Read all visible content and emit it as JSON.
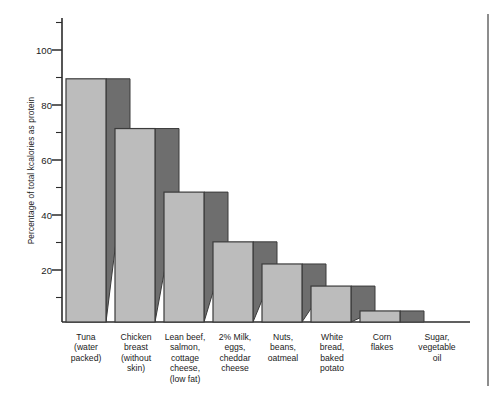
{
  "chart_data": {
    "type": "bar",
    "title": "",
    "xlabel": "",
    "ylabel": "Percentage of total kcalories as protein",
    "ylim": [
      0,
      110
    ],
    "ytick_labels": [
      "20",
      "40",
      "60",
      "80",
      "100"
    ],
    "ytick_values": [
      20,
      40,
      60,
      80,
      100
    ],
    "minor_tick_interval": 10,
    "grid": false,
    "legend": "none",
    "categories": [
      "Tuna (water packed)",
      "Chicken breast (without skin)",
      "Lean beef, salmon, cottage cheese, (low fat)",
      "2% Milk, eggs, cheddar cheese",
      "Nuts, beans, oatmeal",
      "White bread, baked potato",
      "Corn flakes",
      "Sugar, vegetable oil"
    ],
    "category_lines": [
      [
        "Tuna",
        "(water",
        "packed)"
      ],
      [
        "Chicken",
        "breast",
        "(without",
        "skin)"
      ],
      [
        "Lean beef,",
        "salmon,",
        "cottage",
        "cheese,",
        "(low fat)"
      ],
      [
        "2% Milk,",
        "eggs,",
        "cheddar",
        "cheese"
      ],
      [
        "Nuts,",
        "beans,",
        "oatmeal"
      ],
      [
        "White",
        "bread,",
        "baked",
        "potato"
      ],
      [
        "Corn",
        "flakes"
      ],
      [
        "Sugar,",
        "vegetable",
        "oil"
      ]
    ],
    "values": [
      88,
      70,
      47,
      29,
      21,
      13,
      4,
      0
    ],
    "colors": {
      "bar_face": "#bcbcbc",
      "bar_side": "#6e6e6e",
      "bar_outline": "#3b3b3b",
      "axis": "#2b2b2b",
      "background": "#ffffff",
      "text": "#1b1b1b"
    }
  }
}
